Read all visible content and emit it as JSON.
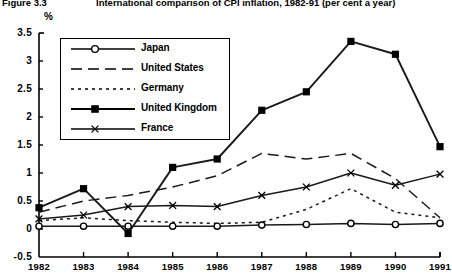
{
  "figure": {
    "label": "Figure 3.3",
    "title": "International comparison of CPI inflation, 1982-91 (per cent a year)"
  },
  "chart_data": {
    "type": "line",
    "title": "International comparison of CPI inflation, 1982-91 (per cent a year)",
    "xlabel": "",
    "ylabel": "%",
    "unit_label": "%",
    "categories": [
      "1982",
      "1983",
      "1984",
      "1985",
      "1986",
      "1987",
      "1988",
      "1989",
      "1990",
      "1991"
    ],
    "x": [
      1982,
      1983,
      1984,
      1985,
      1986,
      1987,
      1988,
      1989,
      1990,
      1991
    ],
    "ylim": [
      -0.5,
      3.5
    ],
    "yticks": [
      "-0.5",
      "0",
      "0.5",
      "1",
      "1.5",
      "2",
      "2.5",
      "3",
      "3.5"
    ],
    "ytick_values": [
      -0.5,
      0,
      0.5,
      1,
      1.5,
      2,
      2.5,
      3,
      3.5
    ],
    "grid": false,
    "legend_position": "upper-left-inside",
    "series": [
      {
        "name": "Japan",
        "marker": "open-circle",
        "line_style": "solid",
        "values": [
          0.05,
          0.05,
          0.05,
          0.05,
          0.05,
          0.07,
          0.08,
          0.1,
          0.08,
          0.1
        ]
      },
      {
        "name": "United States",
        "marker": "none",
        "line_style": "dashed",
        "values": [
          0.3,
          0.5,
          0.6,
          0.75,
          0.95,
          1.35,
          1.25,
          1.35,
          0.9,
          0.2
        ]
      },
      {
        "name": "Germany",
        "marker": "none",
        "line_style": "dotted",
        "values": [
          0.15,
          0.2,
          0.15,
          0.12,
          0.1,
          0.12,
          0.35,
          0.72,
          0.3,
          0.2
        ]
      },
      {
        "name": "United Kingdom",
        "marker": "filled-square",
        "line_style": "solid",
        "values": [
          0.38,
          0.72,
          -0.08,
          1.1,
          1.25,
          2.12,
          2.45,
          3.35,
          3.12,
          1.47
        ]
      },
      {
        "name": "France",
        "marker": "cross",
        "line_style": "solid",
        "values": [
          0.18,
          0.25,
          0.4,
          0.42,
          0.4,
          0.6,
          0.75,
          1.0,
          0.78,
          0.98
        ]
      }
    ]
  },
  "colors": {
    "axis": "#000000",
    "series": "#1a1a1a",
    "background": "#ffffff"
  }
}
